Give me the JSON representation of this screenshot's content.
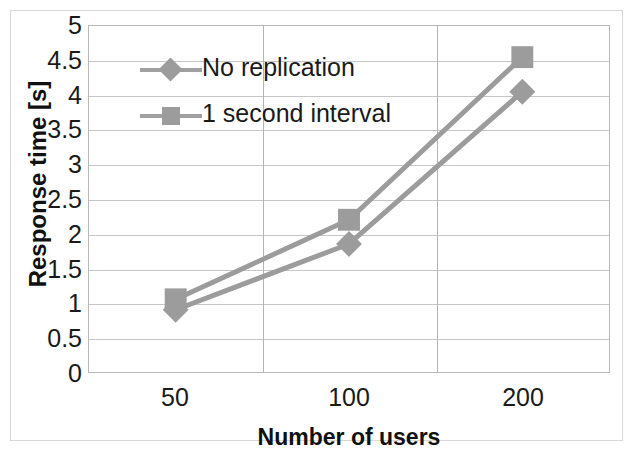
{
  "chart_data": {
    "type": "line",
    "title": "",
    "xlabel": "Number of users",
    "ylabel": "Response time [s]",
    "categories": [
      "50",
      "100",
      "200"
    ],
    "series": [
      {
        "name": "No replication",
        "marker": "diamond",
        "values": [
          0.9,
          1.85,
          4.05
        ]
      },
      {
        "name": "1 second interval",
        "marker": "square",
        "values": [
          1.05,
          2.2,
          4.55
        ]
      }
    ],
    "ylim": [
      0,
      5
    ],
    "ytick_step": 0.5,
    "yticks": [
      "0",
      "0.5",
      "1",
      "1.5",
      "2",
      "2.5",
      "3",
      "3.5",
      "4",
      "4.5",
      "5"
    ],
    "grid": "horizontal-and-vertical",
    "legend_position": "inside-top-left",
    "colors": {
      "series_line": "#9c9c9c",
      "marker": "#9c9c9c",
      "gridline": "#c6c6c6",
      "axis_text": "#1a1a1a",
      "plot_border": "#b9b9b9",
      "background": "#ffffff"
    }
  },
  "legend": {
    "items": [
      {
        "label": "No replication",
        "marker": "diamond"
      },
      {
        "label": "1 second interval",
        "marker": "square"
      }
    ]
  }
}
